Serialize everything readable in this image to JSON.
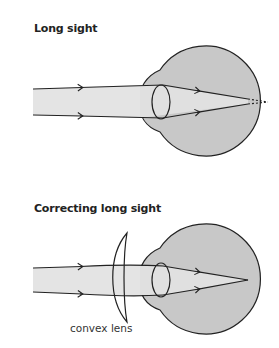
{
  "diagrams": [
    {
      "title": "Long sight",
      "description": "Parallel rays enter the eye and would focus behind the retina"
    },
    {
      "title": "Correcting long sight",
      "lens_label": "convex lens",
      "description": "A convex lens converges rays so they focus on the retina"
    }
  ],
  "colors": {
    "eye_fill": "#c8c8c8",
    "beam_fill": "#e4e4e4",
    "stroke": "#222222"
  }
}
